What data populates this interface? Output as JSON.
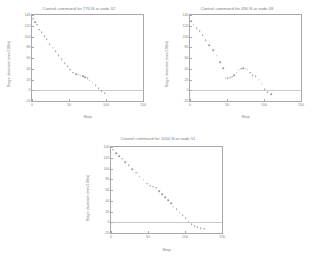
{
  "page": {
    "background": "#ffffff",
    "marker_color": "#9a9a9a",
    "axis_color": "#a8a8a8",
    "text_color": "#7d7d7d"
  },
  "charts": [
    {
      "id": "chart-770n-node32",
      "title": "Control command for 770 N at node 32",
      "xlabel": "Step",
      "ylabel": "Stage deviation (mm/100m)"
    },
    {
      "id": "chart-490n-node48",
      "title": "Control command for  490 N at node 48",
      "xlabel": "Step",
      "ylabel": "Stage deviation (mm/100m)"
    },
    {
      "id": "chart-1000n-node51",
      "title": "Control command for 1000 N at node 51",
      "xlabel": "Step",
      "ylabel": "Stage deviation (mm/100m)"
    }
  ],
  "chart_data": [
    {
      "type": "scatter",
      "title": "Control command for 770 N at node 32",
      "xlabel": "Step",
      "ylabel": "Stage deviation (mm/100m)",
      "xlim": [
        0,
        150
      ],
      "ylim": [
        -20,
        140
      ],
      "xticks": [
        0,
        50,
        100,
        150
      ],
      "yticks": [
        -20,
        0,
        20,
        40,
        60,
        80,
        100,
        120,
        140
      ],
      "grid": false,
      "legend": null,
      "zero_reference_line": 0,
      "series": [
        {
          "name": "stage deviation",
          "marker": "dot",
          "x": [
            2,
            4,
            7,
            10,
            13,
            17,
            20,
            24,
            28,
            32,
            36,
            40,
            44,
            48,
            52,
            56,
            60,
            63,
            66,
            69,
            72,
            75,
            78,
            82,
            86,
            90,
            94,
            98
          ],
          "y": [
            133,
            127,
            122,
            113,
            108,
            101,
            95,
            86,
            79,
            73,
            65,
            58,
            50,
            45,
            38,
            33,
            30,
            29,
            27,
            26,
            24,
            22,
            18,
            14,
            9,
            4,
            -2,
            -6
          ]
        }
      ]
    },
    {
      "type": "scatter",
      "title": "Control command for  490 N at node 48",
      "xlabel": "Step",
      "ylabel": "Stage deviation (mm/100m)",
      "xlim": [
        0,
        150
      ],
      "ylim": [
        -20,
        140
      ],
      "xticks": [
        0,
        50,
        100,
        150
      ],
      "yticks": [
        -20,
        0,
        20,
        40,
        60,
        80,
        100,
        120,
        140
      ],
      "grid": false,
      "legend": null,
      "zero_reference_line": 0,
      "series": [
        {
          "name": "stage deviation",
          "marker": "dot",
          "x": [
            2,
            5,
            9,
            13,
            17,
            21,
            26,
            31,
            36,
            41,
            45,
            48,
            51,
            54,
            57,
            60,
            63,
            66,
            69,
            72,
            75,
            78,
            81,
            85,
            89,
            93,
            97,
            101,
            105,
            110
          ],
          "y": [
            128,
            122,
            115,
            110,
            102,
            93,
            84,
            74,
            64,
            52,
            41,
            23,
            22,
            23,
            25,
            28,
            33,
            38,
            40,
            41,
            40,
            38,
            33,
            28,
            26,
            20,
            12,
            2,
            -4,
            -7
          ]
        }
      ]
    },
    {
      "type": "scatter",
      "title": "Control command for 1000 N at node 51",
      "xlabel": "Step",
      "ylabel": "Stage deviation (mm/100m)",
      "xlim": [
        0,
        150
      ],
      "ylim": [
        -20,
        140
      ],
      "xticks": [
        0,
        50,
        100,
        150
      ],
      "yticks": [
        -20,
        0,
        20,
        40,
        60,
        80,
        100,
        120,
        140
      ],
      "grid": false,
      "legend": null,
      "zero_reference_line": 0,
      "series": [
        {
          "name": "stage deviation",
          "marker": "dot",
          "x": [
            3,
            7,
            11,
            15,
            19,
            24,
            29,
            34,
            39,
            44,
            49,
            53,
            57,
            61,
            65,
            69,
            73,
            77,
            81,
            85,
            89,
            93,
            97,
            101,
            105,
            109,
            113,
            117,
            121,
            126
          ],
          "y": [
            135,
            128,
            123,
            118,
            112,
            106,
            99,
            92,
            85,
            79,
            72,
            68,
            66,
            64,
            58,
            52,
            47,
            41,
            35,
            29,
            24,
            18,
            13,
            7,
            1,
            -4,
            -7,
            -9,
            -11,
            -12
          ]
        }
      ]
    }
  ]
}
